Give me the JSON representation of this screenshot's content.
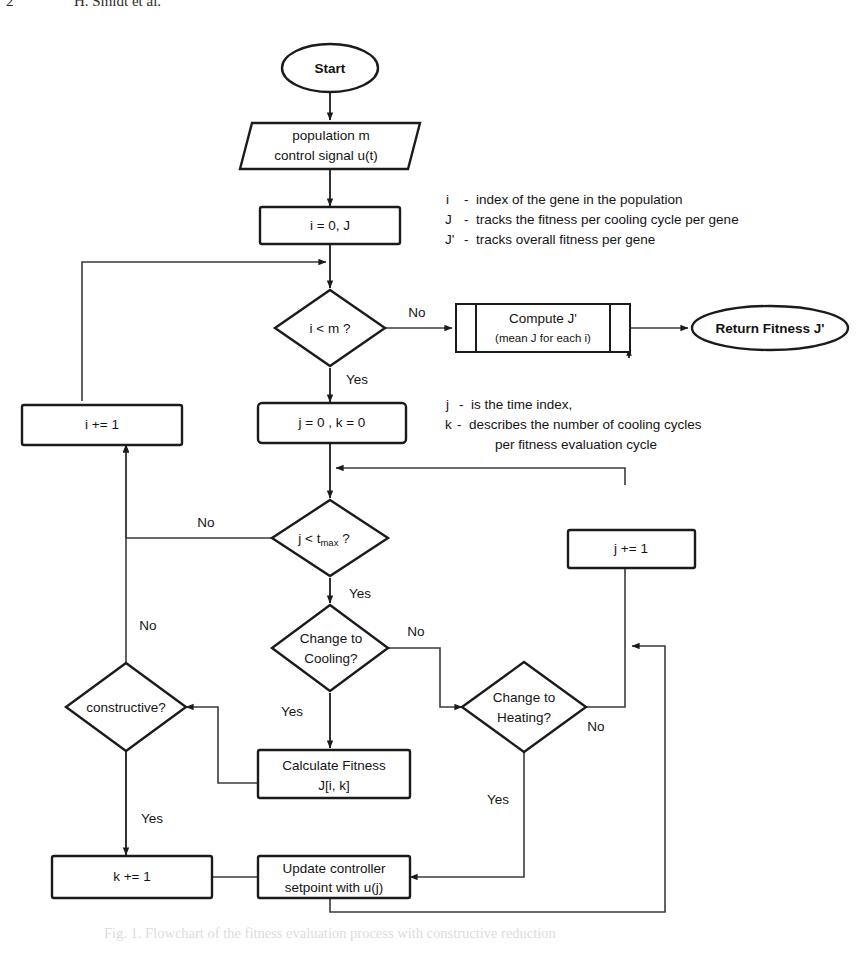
{
  "page": {
    "running_head_folio": "2",
    "running_head_authors": "H. Smidt et al.",
    "caption": "Fig. 1. Flowchart of the fitness evaluation process with constructive reduction"
  },
  "legend": {
    "group_1": [
      {
        "symbol": "i",
        "dash": "-",
        "text": "index of the gene in the population"
      },
      {
        "symbol": "J",
        "dash": "-",
        "text": "tracks the fitness per cooling cycle per gene"
      },
      {
        "symbol": "J'",
        "dash": "-",
        "text": "tracks overall fitness per gene"
      }
    ],
    "group_2": [
      {
        "symbol": "j",
        "dash": "-",
        "text": "is the time index,"
      },
      {
        "symbol": "k",
        "dash": "-",
        "text": "describes the number of cooling cycles"
      },
      {
        "symbol": "",
        "dash": "",
        "text": "per fitness evaluation cycle"
      }
    ]
  },
  "nodes": {
    "start": {
      "label": "Start",
      "shape": "terminator"
    },
    "inputs": {
      "line1": "population m",
      "line2": "control signal u(t)",
      "shape": "parallelogram"
    },
    "init_i": {
      "label": "i = 0, J",
      "shape": "process"
    },
    "check_i": {
      "label": "i < m ?",
      "shape": "decision"
    },
    "compute_jp": {
      "line1": "Compute J'",
      "line2": "(mean J for each i)",
      "shape": "predefined-process"
    },
    "return_fit": {
      "label": "Return Fitness J'",
      "shape": "terminator"
    },
    "inc_i": {
      "label": "i += 1",
      "shape": "process"
    },
    "init_jk": {
      "label": "j = 0 , k = 0",
      "shape": "process"
    },
    "check_j": {
      "label_pre": "j < t",
      "label_sub": "max",
      "label_post": " ?",
      "shape": "decision"
    },
    "inc_j": {
      "label": "j += 1",
      "shape": "process"
    },
    "change_cool": {
      "line1": "Change to",
      "line2": "Cooling?",
      "shape": "decision"
    },
    "change_heat": {
      "line1": "Change to",
      "line2": "Heating?",
      "shape": "decision"
    },
    "calc_fitness": {
      "line1": "Calculate Fitness",
      "line2": "J[i, k]",
      "shape": "process"
    },
    "constructive": {
      "label": "constructive?",
      "shape": "decision"
    },
    "inc_k": {
      "label": "k += 1",
      "shape": "process"
    },
    "update_ctrl": {
      "line1": "Update controller",
      "line2": "setpoint with u(j)",
      "shape": "process"
    }
  },
  "edge_labels": {
    "check_i_no": "No",
    "check_i_yes": "Yes",
    "check_j_no": "No",
    "check_j_yes": "Yes",
    "change_cool_no": "No",
    "change_cool_yes": "Yes",
    "change_heat_no": "No",
    "change_heat_yes": "Yes",
    "constructive_no": "No",
    "constructive_yes": "Yes"
  },
  "colors": {
    "stroke": "#1b1b1b",
    "link": "#3b3b3b",
    "background": "#ffffff"
  }
}
